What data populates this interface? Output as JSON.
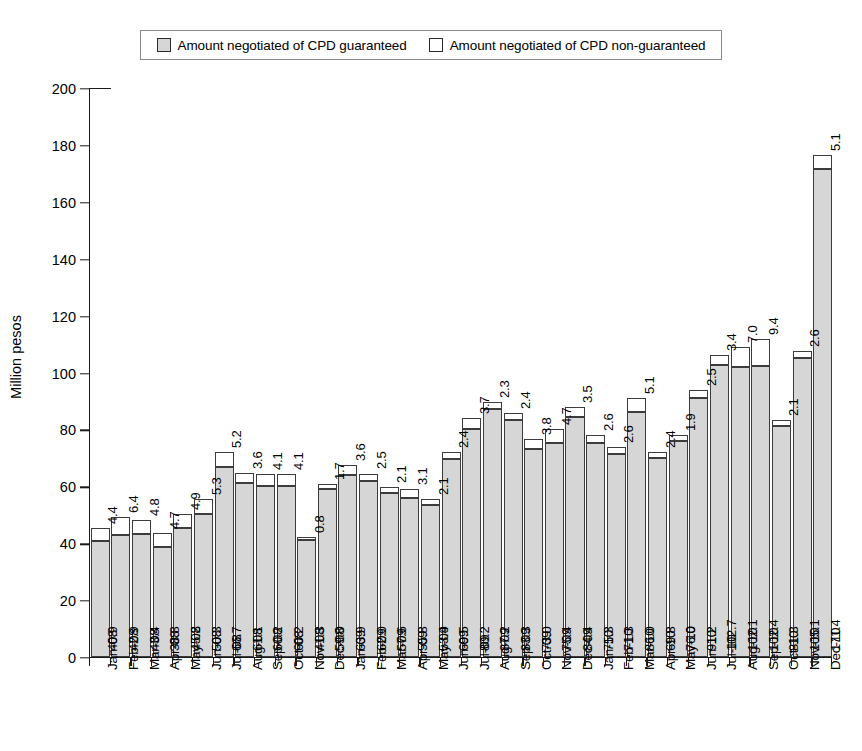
{
  "legend": {
    "items": [
      {
        "label": "Amount negotiated of CPD guaranteed",
        "swatch": "guaranteed-swatch",
        "color": "#d6d6d6"
      },
      {
        "label": "Amount negotiated of CPD non-guaranteed",
        "swatch": "non-guaranteed-swatch",
        "color": "#ffffff"
      }
    ]
  },
  "chart_data": {
    "type": "bar",
    "subtype": "stacked",
    "title": "",
    "xlabel": "",
    "ylabel": "Million pesos",
    "ylim": [
      0,
      200
    ],
    "yticks": [
      0,
      20,
      40,
      60,
      80,
      100,
      120,
      140,
      160,
      180,
      200
    ],
    "grid": false,
    "legend_position": "top",
    "categories": [
      "Jan-08",
      "Feb-08",
      "Mar-08",
      "Apr-08",
      "May-08",
      "Jun-08",
      "Jul-08",
      "Aug-08",
      "Sep-08",
      "Oct-08",
      "Nov-08",
      "Dec-08",
      "Jan-09",
      "Feb-09",
      "Mar-09",
      "Apr-09",
      "May-09",
      "Jun-09",
      "Jul-09",
      "Aug-09",
      "Sep-09",
      "Oct-09",
      "Nov-09",
      "Dec-09",
      "Jan-10",
      "Feb-10",
      "Mar-10",
      "Apr-10",
      "May-10",
      "Jun-10",
      "Jul-10",
      "Aug-10",
      "Sep-10",
      "Oct-10",
      "Nov-10",
      "Dec-10"
    ],
    "series": [
      {
        "name": "Amount negotiated of CPD guaranteed",
        "color": "#d6d6d6",
        "values": [
          40.9,
          42.9,
          43.4,
          38.8,
          45.2,
          50.3,
          66.7,
          61.1,
          60.2,
          60.2,
          41.3,
          59.0,
          63.9,
          62.0,
          57.6,
          55.8,
          53.4,
          69.5,
          80.2,
          87.2,
          83.3,
          73.0,
          75.4,
          84.4,
          75.3,
          71.3,
          86.0,
          69.8,
          76.0,
          91.2,
          102.7,
          102.1,
          102.4,
          81.3,
          105.1,
          171.4
        ]
      },
      {
        "name": "Amount negotiated of CPD non-guaranteed",
        "color": "#ffffff",
        "values": [
          4.4,
          6.4,
          4.8,
          4.7,
          4.9,
          5.3,
          5.2,
          3.6,
          4.1,
          4.1,
          0.8,
          1.7,
          3.6,
          2.5,
          2.1,
          3.1,
          2.1,
          2.4,
          3.7,
          2.3,
          2.4,
          3.8,
          4.7,
          3.5,
          2.6,
          2.6,
          5.1,
          2.4,
          1.9,
          2.5,
          3.4,
          7.0,
          9.4,
          2.1,
          2.6,
          5.1
        ]
      }
    ]
  }
}
